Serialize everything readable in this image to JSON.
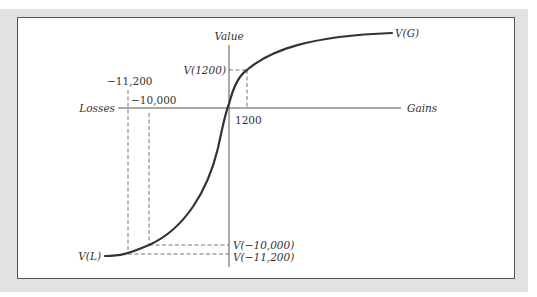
{
  "diagram": {
    "axes": {
      "y_label": "Value",
      "x_negative_label": "Losses",
      "x_positive_label": "Gains"
    },
    "x_ticks": {
      "gain": "1200",
      "loss_small": "−10,000",
      "loss_large": "−11,200"
    },
    "y_ticks": {
      "v_gain": "V(1200)",
      "v_loss_small": "V(−10,000)",
      "v_loss_large": "V(−11,200)"
    },
    "curve_labels": {
      "upper_end": "V(G)",
      "lower_end": "V(L)"
    },
    "colors": {
      "curve": "#333333",
      "axis": "#555555",
      "dashes": "#666666",
      "frame": "#e2e2e2"
    }
  }
}
